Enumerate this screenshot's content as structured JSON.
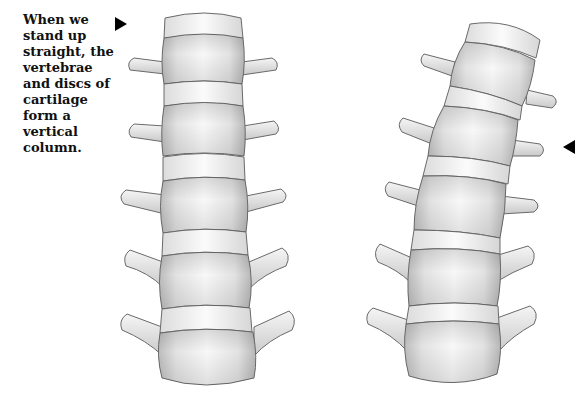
{
  "caption": "When we stand up straight, the vertebrae and discs of cartilage form a vertical column.",
  "figures": [
    {
      "name": "straight-spine",
      "description": "Lumbar vertebrae stacked vertically",
      "vertebrae_count": 5,
      "disc_count": 5
    },
    {
      "name": "curved-spine",
      "description": "Lumbar vertebrae in a tilted, curved column",
      "vertebrae_count": 5,
      "disc_count": 5
    }
  ],
  "markers": [
    {
      "name": "arrow-pointing-right",
      "target": "straight-spine"
    },
    {
      "name": "arrow-pointing-left",
      "target": "curved-spine"
    }
  ],
  "colors": {
    "bone_light": "#f4f4f4",
    "bone_shade": "#c8c8c8",
    "disc": "#f7f7f7",
    "outline": "#6a6a6a",
    "text": "#111111"
  }
}
